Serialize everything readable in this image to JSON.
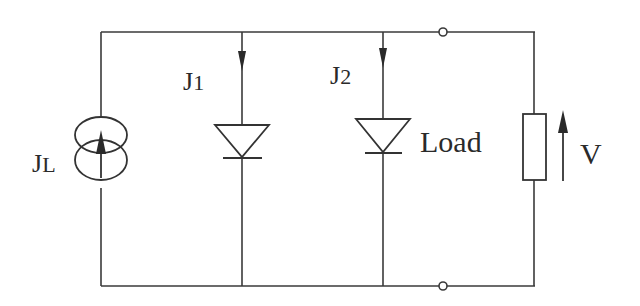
{
  "diagram": {
    "type": "circuit",
    "labels": {
      "source_main": "J",
      "source_sub": "L",
      "diode1_main": "J",
      "diode1_sub": "1",
      "diode2_main": "J",
      "diode2_sub": "2",
      "load": "Load",
      "voltage": "V"
    },
    "components": [
      {
        "id": "current-source",
        "kind": "current source",
        "label": "JL",
        "arrow": "up"
      },
      {
        "id": "diode-1",
        "kind": "diode",
        "label": "J1",
        "current_arrow": "down"
      },
      {
        "id": "diode-2",
        "kind": "diode",
        "label": "J2",
        "current_arrow": "down"
      },
      {
        "id": "load-resistor",
        "kind": "resistor",
        "label": "Load"
      },
      {
        "id": "voltage-arrow",
        "kind": "voltage indicator",
        "label": "V",
        "arrow": "up"
      },
      {
        "id": "terminal-top",
        "kind": "terminal"
      },
      {
        "id": "terminal-bottom",
        "kind": "terminal"
      }
    ],
    "colors": {
      "line": "#3a3a3a",
      "background": "#ffffff"
    }
  }
}
